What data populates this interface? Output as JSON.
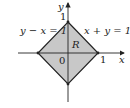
{
  "diagram": {
    "type": "coordinate-region",
    "axes": {
      "x_label": "x",
      "y_label": "y"
    },
    "origin_label": "0",
    "ticks": {
      "x_tick": "1",
      "y_tick": "1"
    },
    "region_label": "R",
    "lines": [
      {
        "label": "y − x = 1"
      },
      {
        "label": "x + y = 1"
      }
    ],
    "region": {
      "shape": "square (diamond) with vertices (1,0), (0,1), (−1,0), (0,−1)",
      "fill": "#c8c8c8",
      "stroke": "#222222"
    }
  }
}
